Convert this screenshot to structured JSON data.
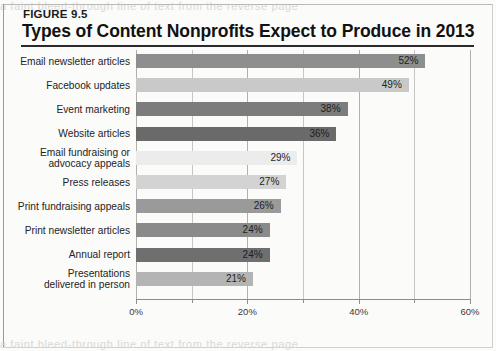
{
  "figure": {
    "number_label": "FIGURE 9.5",
    "title": "Types of Content Nonprofits Expect to Produce in 2013"
  },
  "ghost_text": {
    "top": "a faint bleed-through line of text from the reverse page",
    "bottom": "a faint bleed-through line of text from the reverse page"
  },
  "colors": {
    "background": "#fbfbfa",
    "title_text": "#111111",
    "rule": "#2a2a2a",
    "grid": "#c6c6c4",
    "axis": "#8d8d8b",
    "bar_medium": "#8e8e8e",
    "bar_light": "#c9c9c9",
    "bar_dark": "#6e6e6e",
    "bar_pale": "#e4e4e4",
    "value_text": "#1e1e1e"
  },
  "chart_data": {
    "type": "bar",
    "orientation": "horizontal",
    "title": "Types of Content Nonprofits Expect to Produce in 2013",
    "subtitle": "FIGURE 9.5",
    "xlabel": "",
    "ylabel": "",
    "xlim": [
      0,
      60
    ],
    "xticks": [
      0,
      20,
      40,
      60
    ],
    "xtick_labels": [
      "0%",
      "20%",
      "40%",
      "60%"
    ],
    "minor_xticks": [
      10,
      30,
      50
    ],
    "grid": true,
    "legend": false,
    "value_label_suffix": "%",
    "categories": [
      "Email newsletter articles",
      "Facebook updates",
      "Event marketing",
      "Website articles",
      "Email fundraising or advocacy appeals",
      "Press releases",
      "Print fundraising appeals",
      "Print newsletter articles",
      "Annual report",
      "Presentations delivered in person"
    ],
    "values": [
      52,
      49,
      38,
      36,
      29,
      27,
      26,
      24,
      24,
      21
    ],
    "value_labels": [
      "52%",
      "49%",
      "38%",
      "36%",
      "29%",
      "27%",
      "26%",
      "24%",
      "24%",
      "21%"
    ],
    "bar_colors": [
      "#8e8e8e",
      "#c9c9c9",
      "#7c7c7c",
      "#6a6a6a",
      "#ececec",
      "#d3d3d3",
      "#9a9a9a",
      "#8a8a8a",
      "#6f6f6f",
      "#b4b4b4"
    ],
    "bars": [
      {
        "label": "Email newsletter articles",
        "label_lines": [
          "Email newsletter articles"
        ],
        "value": 52,
        "value_label": "52%",
        "color": "#8e8e8e"
      },
      {
        "label": "Facebook updates",
        "label_lines": [
          "Facebook updates"
        ],
        "value": 49,
        "value_label": "49%",
        "color": "#c9c9c9"
      },
      {
        "label": "Event marketing",
        "label_lines": [
          "Event marketing"
        ],
        "value": 38,
        "value_label": "38%",
        "color": "#7c7c7c"
      },
      {
        "label": "Website articles",
        "label_lines": [
          "Website articles"
        ],
        "value": 36,
        "value_label": "36%",
        "color": "#6a6a6a"
      },
      {
        "label": "Email fundraising or advocacy appeals",
        "label_lines": [
          "Email fundraising or",
          "advocacy appeals"
        ],
        "value": 29,
        "value_label": "29%",
        "color": "#ececec"
      },
      {
        "label": "Press releases",
        "label_lines": [
          "Press releases"
        ],
        "value": 27,
        "value_label": "27%",
        "color": "#d3d3d3"
      },
      {
        "label": "Print fundraising appeals",
        "label_lines": [
          "Print fundraising appeals"
        ],
        "value": 26,
        "value_label": "26%",
        "color": "#9a9a9a"
      },
      {
        "label": "Print newsletter articles",
        "label_lines": [
          "Print newsletter articles"
        ],
        "value": 24,
        "value_label": "24%",
        "color": "#8a8a8a"
      },
      {
        "label": "Annual report",
        "label_lines": [
          "Annual report"
        ],
        "value": 24,
        "value_label": "24%",
        "color": "#6f6f6f"
      },
      {
        "label": "Presentations delivered in person",
        "label_lines": [
          "Presentations",
          "delivered in person"
        ],
        "value": 21,
        "value_label": "21%",
        "color": "#b4b4b4"
      }
    ]
  }
}
